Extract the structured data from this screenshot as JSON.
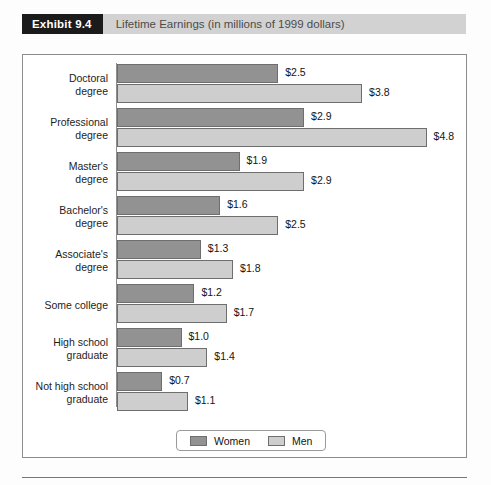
{
  "header": {
    "tag": "Exhibit 9.4",
    "title": "Lifetime Earnings (in millions of 1999 dollars)"
  },
  "legend": {
    "items": [
      {
        "label": "Women",
        "color": "#929292"
      },
      {
        "label": "Men",
        "color": "#cecece"
      }
    ]
  },
  "chart_data": {
    "type": "bar",
    "orientation": "horizontal",
    "title": "Lifetime Earnings (in millions of 1999 dollars)",
    "xlabel": "",
    "ylabel": "",
    "xlim": [
      0,
      5.4
    ],
    "grid": false,
    "legend_position": "bottom-center",
    "value_prefix": "$",
    "categories": [
      "Doctoral degree",
      "Professional degree",
      "Master's degree",
      "Bachelor's degree",
      "Associate's degree",
      "Some college",
      "High school graduate",
      "Not high school graduate"
    ],
    "category_lines": [
      [
        "Doctoral",
        "degree"
      ],
      [
        "Professional",
        "degree"
      ],
      [
        "Master's",
        "degree"
      ],
      [
        "Bachelor's",
        "degree"
      ],
      [
        "Associate's",
        "degree"
      ],
      [
        "Some college"
      ],
      [
        "High school",
        "graduate"
      ],
      [
        "Not high school",
        "graduate"
      ]
    ],
    "series": [
      {
        "name": "Women",
        "color": "#929292",
        "values": [
          2.5,
          2.9,
          1.9,
          1.6,
          1.3,
          1.2,
          1.0,
          0.7
        ],
        "labels": [
          "$2.5",
          "$2.9",
          "$1.9",
          "$1.6",
          "$1.3",
          "$1.2",
          "$1.0",
          "$0.7"
        ]
      },
      {
        "name": "Men",
        "color": "#cecece",
        "values": [
          3.8,
          4.8,
          2.9,
          2.5,
          1.8,
          1.7,
          1.4,
          1.1
        ],
        "labels": [
          "$3.8",
          "$4.8",
          "$2.9",
          "$2.5",
          "$1.8",
          "$1.7",
          "$1.4",
          "$1.1"
        ]
      }
    ]
  }
}
